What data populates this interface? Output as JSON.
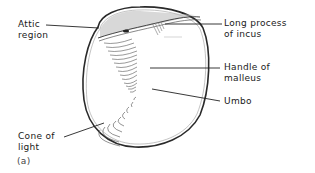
{
  "figure": {
    "panel_label": "(a)"
  },
  "labels": {
    "attic": {
      "line1": "Attic",
      "line2": "region"
    },
    "incus": {
      "line1": "Long process",
      "line2": "of incus"
    },
    "malleus": {
      "line1": "Handle of",
      "line2": "malleus"
    },
    "umbo": {
      "line1": "Umbo"
    },
    "cone": {
      "line1": "Cone of",
      "line2": "light"
    }
  },
  "colors": {
    "outline": "#2a2a2a",
    "hatch": "#555555",
    "background": "#ffffff"
  }
}
